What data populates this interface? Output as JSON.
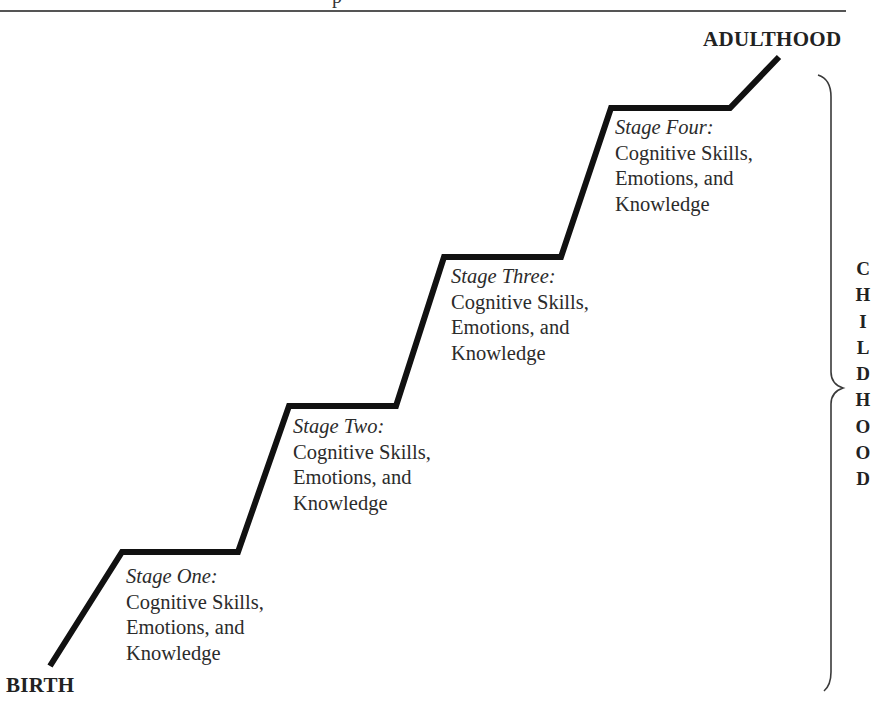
{
  "header": {
    "fragment_text": "p"
  },
  "diagram": {
    "type": "staircase",
    "start_label": "BIRTH",
    "end_label": "ADULTHOOD",
    "brace_label": "CHILDHOOD",
    "brace_letters": [
      "C",
      "H",
      "I",
      "L",
      "D",
      "H",
      "O",
      "O",
      "D"
    ],
    "line_color": "#111111",
    "brace_color": "#3a3a3a",
    "stages": [
      {
        "title": "Stage One:",
        "lines": [
          "Cognitive Skills,",
          "Emotions, and",
          "Knowledge"
        ]
      },
      {
        "title": "Stage Two:",
        "lines": [
          "Cognitive Skills,",
          "Emotions, and",
          "Knowledge"
        ]
      },
      {
        "title": "Stage Three:",
        "lines": [
          "Cognitive Skills,",
          "Emotions, and",
          "Knowledge"
        ]
      },
      {
        "title": "Stage Four:",
        "lines": [
          "Cognitive Skills,",
          "Emotions, and",
          "Knowledge"
        ]
      }
    ]
  }
}
